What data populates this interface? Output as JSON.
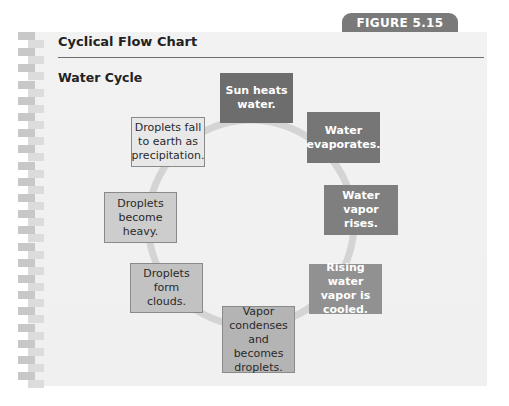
{
  "figure_label": "FIGURE 5.15",
  "title": "Cyclical Flow Chart",
  "subtitle": "Water Cycle",
  "diagram": {
    "type": "cycle",
    "ring_color": "#d4d4d4",
    "steps": [
      {
        "order": 1,
        "label": "Sun heats water.",
        "bg": "#6d6d6d",
        "fg": "#ffffff",
        "bold": true
      },
      {
        "order": 2,
        "label": "Water evaporates.",
        "bg": "#767676",
        "fg": "#ffffff",
        "bold": true
      },
      {
        "order": 3,
        "label": "Water vapor rises.",
        "bg": "#7f7f7f",
        "fg": "#ffffff",
        "bold": true
      },
      {
        "order": 4,
        "label": "Rising water vapor is cooled.",
        "bg": "#919191",
        "fg": "#ffffff",
        "bold": true
      },
      {
        "order": 5,
        "label": "Vapor condenses and becomes droplets.",
        "bg": "#b4b4b4",
        "fg": "#2a2a2a",
        "bold": false
      },
      {
        "order": 6,
        "label": "Droplets form clouds.",
        "bg": "#c2c2c2",
        "fg": "#2a2a2a",
        "bold": false
      },
      {
        "order": 7,
        "label": "Droplets become heavy.",
        "bg": "#cdcdcd",
        "fg": "#2a2a2a",
        "bold": false
      },
      {
        "order": 8,
        "label": "Droplets fall to earth as precipitation.",
        "bg": "#e8e8e8",
        "fg": "#2a2a2a",
        "bold": false
      }
    ]
  }
}
